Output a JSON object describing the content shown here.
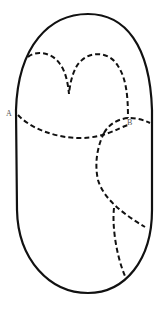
{
  "diagram": {
    "type": "outline-with-dashed-regions",
    "stroke_color": "#111111",
    "label_color": "#555555",
    "labels": [
      {
        "id": "A",
        "text": "A",
        "x": 6,
        "y": 111
      },
      {
        "id": "B",
        "text": "B",
        "x": 127,
        "y": 120
      }
    ],
    "outline": {
      "shape": "elongated-oval",
      "style": "solid"
    },
    "dashed_curves": [
      {
        "id": "heart-curve",
        "description": "double-lobed curve with central V notch"
      },
      {
        "id": "A-B-curve",
        "description": "curve from point A across to right edge through B"
      },
      {
        "id": "B-lower-curve",
        "description": "curve from B descending to lower right edge"
      },
      {
        "id": "branch-curve",
        "description": "branch descending to bottom right"
      }
    ]
  }
}
